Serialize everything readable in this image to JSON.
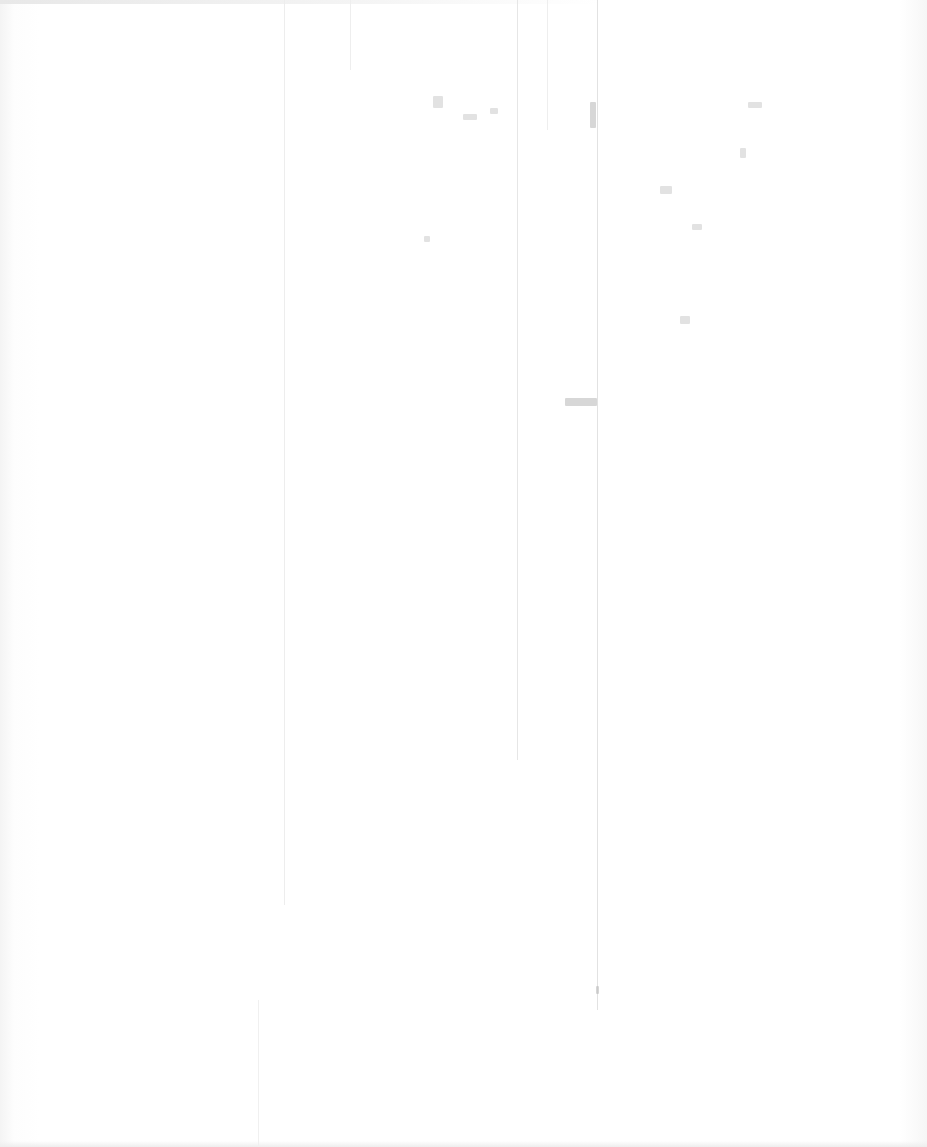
{
  "page": {
    "type": "blank scanned page",
    "text": "",
    "background_color": "#fefefe",
    "artifact_color": "#cfcfcf"
  }
}
